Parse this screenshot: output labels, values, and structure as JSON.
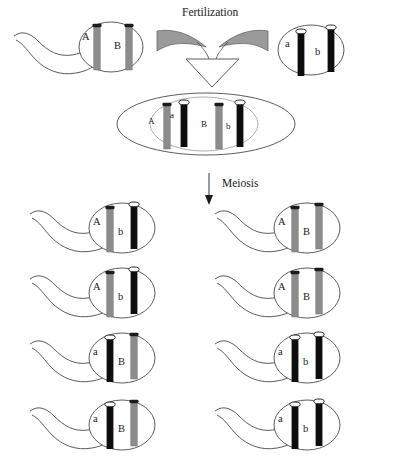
{
  "diagram": {
    "title_process_top": "Fertilization",
    "title_process_mid": "Meiosis",
    "colors": {
      "gray_chromosome": "#8c8c8c",
      "black_chromosome": "#0d0d0d",
      "outline": "#3a3a3a",
      "wing_fill": "#9a9a9a",
      "background": "#ffffff"
    }
  },
  "parents": {
    "sperm": {
      "name": "sperm-cell",
      "chromosomes": [
        {
          "allele": "A",
          "color": "gray",
          "centromere": "dark"
        },
        {
          "allele": "B",
          "color": "gray",
          "centromere": "dark"
        }
      ]
    },
    "egg": {
      "name": "egg-cell",
      "chromosomes": [
        {
          "allele": "a",
          "color": "black",
          "centromere": "light"
        },
        {
          "allele": "b",
          "color": "black",
          "centromere": "light"
        }
      ]
    }
  },
  "zygote": {
    "name": "zygote-cell",
    "chromosomes": [
      {
        "allele": "A",
        "color": "gray",
        "centromere": "dark"
      },
      {
        "allele": "a",
        "color": "black",
        "centromere": "light"
      },
      {
        "allele": "B",
        "color": "gray",
        "centromere": "dark"
      },
      {
        "allele": "b",
        "color": "black",
        "centromere": "light"
      }
    ]
  },
  "gametes": {
    "rows": [
      {
        "left": {
          "label": "gamete-1-left",
          "chromosomes": [
            {
              "allele": "A",
              "color": "gray",
              "centromere": "dark"
            },
            {
              "allele": "b",
              "color": "black",
              "centromere": "light"
            }
          ]
        },
        "right": {
          "label": "gamete-1-right",
          "chromosomes": [
            {
              "allele": "A",
              "color": "gray",
              "centromere": "dark"
            },
            {
              "allele": "B",
              "color": "gray",
              "centromere": "dark"
            }
          ]
        }
      },
      {
        "left": {
          "label": "gamete-2-left",
          "chromosomes": [
            {
              "allele": "A",
              "color": "gray",
              "centromere": "dark"
            },
            {
              "allele": "b",
              "color": "black",
              "centromere": "light"
            }
          ]
        },
        "right": {
          "label": "gamete-2-right",
          "chromosomes": [
            {
              "allele": "A",
              "color": "gray",
              "centromere": "dark"
            },
            {
              "allele": "B",
              "color": "gray",
              "centromere": "dark"
            }
          ]
        }
      },
      {
        "left": {
          "label": "gamete-3-left",
          "chromosomes": [
            {
              "allele": "a",
              "color": "black",
              "centromere": "light"
            },
            {
              "allele": "B",
              "color": "gray",
              "centromere": "dark"
            }
          ]
        },
        "right": {
          "label": "gamete-3-right",
          "chromosomes": [
            {
              "allele": "a",
              "color": "black",
              "centromere": "light"
            },
            {
              "allele": "b",
              "color": "black",
              "centromere": "light"
            }
          ]
        }
      },
      {
        "left": {
          "label": "gamete-4-left",
          "chromosomes": [
            {
              "allele": "a",
              "color": "black",
              "centromere": "light"
            },
            {
              "allele": "B",
              "color": "gray",
              "centromere": "dark"
            }
          ]
        },
        "right": {
          "label": "gamete-4-right",
          "chromosomes": [
            {
              "allele": "a",
              "color": "black",
              "centromere": "light"
            },
            {
              "allele": "b",
              "color": "black",
              "centromere": "light"
            }
          ]
        }
      }
    ]
  }
}
